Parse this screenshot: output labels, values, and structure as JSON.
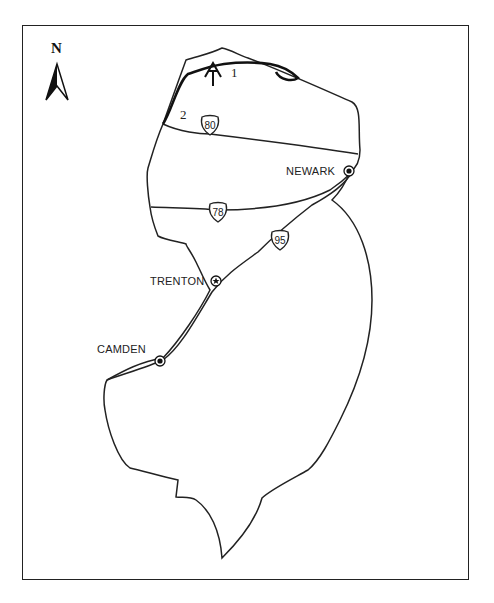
{
  "map": {
    "title": "",
    "north_label": "N",
    "cities": [
      {
        "name": "NEWARK",
        "symbol": "city-dot"
      },
      {
        "name": "TRENTON",
        "symbol": "capital-star"
      },
      {
        "name": "CAMDEN",
        "symbol": "city-dot"
      }
    ],
    "highways": [
      {
        "number": "80",
        "type": "interstate"
      },
      {
        "number": "78",
        "type": "interstate"
      },
      {
        "number": "95",
        "type": "interstate"
      }
    ],
    "trail": {
      "symbol": "appalachian-trail-icon",
      "markers": [
        "1",
        "2"
      ]
    },
    "colors": {
      "line": "#222222",
      "background": "#ffffff"
    }
  }
}
